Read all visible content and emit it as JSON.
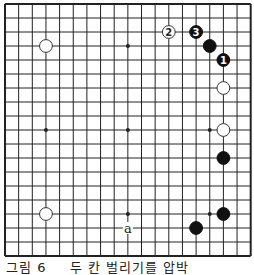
{
  "diagram": {
    "type": "go-board-partial",
    "grid": {
      "columns": 19,
      "rows": 19,
      "origin_x": 5,
      "origin_y": 4,
      "spacing_x": 13.65,
      "spacing_y": 14,
      "line_color": "#222222",
      "border_edges": [
        "left",
        "top",
        "bottom",
        "right"
      ]
    },
    "star_points": [
      {
        "col": 9,
        "row": 3
      },
      {
        "col": 3,
        "row": 9
      },
      {
        "col": 9,
        "row": 9
      },
      {
        "col": 15,
        "row": 9
      },
      {
        "col": 9,
        "row": 15
      },
      {
        "col": 15,
        "row": 15
      }
    ],
    "stones": [
      {
        "color": "white",
        "col": 3,
        "row": 3,
        "label": ""
      },
      {
        "color": "white",
        "col": 12,
        "row": 2,
        "label": "2"
      },
      {
        "color": "black",
        "col": 14,
        "row": 2,
        "label": "3"
      },
      {
        "color": "black",
        "col": 15,
        "row": 3,
        "label": ""
      },
      {
        "color": "black",
        "col": 16,
        "row": 4,
        "label": "1"
      },
      {
        "color": "white",
        "col": 16,
        "row": 6,
        "label": ""
      },
      {
        "color": "white",
        "col": 16,
        "row": 9,
        "label": ""
      },
      {
        "color": "black",
        "col": 16,
        "row": 11,
        "label": ""
      },
      {
        "color": "white",
        "col": 3,
        "row": 15,
        "label": ""
      },
      {
        "color": "black",
        "col": 16,
        "row": 15,
        "label": ""
      },
      {
        "color": "black",
        "col": 14,
        "row": 16,
        "label": ""
      }
    ],
    "markers": [
      {
        "text": "a",
        "col": 9,
        "row": 16
      }
    ],
    "colors": {
      "black_stone": "#111111",
      "white_stone_fill": "#ffffff",
      "white_stone_stroke": "#333333",
      "background": "#ffffff"
    }
  },
  "caption": {
    "figure_label": "그림 6",
    "text": "두 칸 벌리기를 압박"
  }
}
